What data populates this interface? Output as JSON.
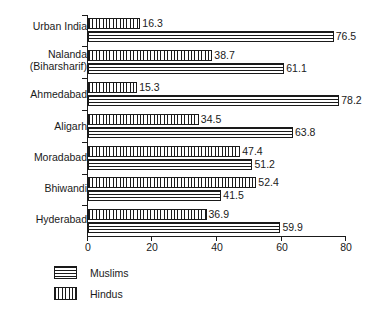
{
  "chart_data": {
    "type": "bar",
    "orientation": "horizontal",
    "title": "",
    "subtitle": "",
    "xlabel": "",
    "ylabel": "",
    "xlim": [
      0,
      80
    ],
    "xticks": [
      0,
      20,
      40,
      60,
      80
    ],
    "xtick_labels": [
      "0",
      "20",
      "40",
      "60",
      "80"
    ],
    "grid": false,
    "legend_position": "bottom-left",
    "categories": [
      "Urban India",
      "Nalanda\n(Biharsharif)",
      "Ahmedabad",
      "Aligarh",
      "Moradabad",
      "Bhiwandi",
      "Hyderabad"
    ],
    "series": [
      {
        "name": "Hindus",
        "pattern": "vertical-stripes",
        "values": [
          16.3,
          38.7,
          15.3,
          34.5,
          47.4,
          52.4,
          36.9
        ],
        "value_labels": [
          "16.3",
          "38.7",
          "15.3",
          "34.5",
          "47.4",
          "52.4",
          "36.9"
        ]
      },
      {
        "name": "Muslims",
        "pattern": "horizontal-stripes",
        "values": [
          76.5,
          61.1,
          78.2,
          63.8,
          51.2,
          41.5,
          59.9
        ],
        "value_labels": [
          "76.5",
          "61.1",
          "78.2",
          "63.8",
          "51.2",
          "41.5",
          "59.9"
        ]
      }
    ],
    "legend": [
      {
        "label": "Muslims",
        "pattern": "horizontal-stripes"
      },
      {
        "label": "Hindus",
        "pattern": "vertical-stripes"
      }
    ],
    "colors": {
      "ink": "#1a1a1a",
      "background": "#ffffff"
    }
  }
}
